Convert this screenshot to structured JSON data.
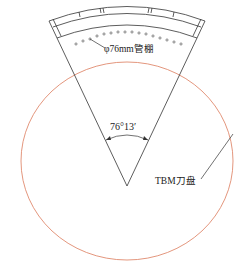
{
  "diagram": {
    "labels": {
      "pipe_roof": "φ76mm管棚",
      "angle": "76°13′",
      "cutterhead": "TBM刀盘"
    },
    "colors": {
      "circle": "#e08a6e",
      "lines": "#333333",
      "text": "#222222"
    },
    "sector_angle_deg": 76.22
  }
}
